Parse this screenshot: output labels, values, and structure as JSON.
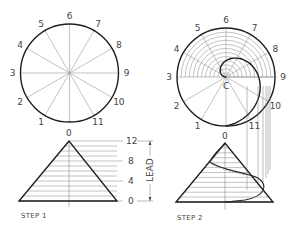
{
  "figure": {
    "step1": {
      "caption": "STEP 1",
      "circle": {
        "cx": 69.5,
        "cy": 73,
        "r": 49
      },
      "division_labels": [
        "0",
        "1",
        "2",
        "3",
        "4",
        "5",
        "6",
        "7",
        "8",
        "9",
        "10",
        "11"
      ],
      "triangle": {
        "apex": [
          69,
          141
        ],
        "base_left": [
          19,
          201
        ],
        "base_right": [
          117,
          201
        ]
      },
      "lead_scale": {
        "labels": [
          {
            "text": "12",
            "y": 141
          },
          {
            "text": "8",
            "y": 161
          },
          {
            "text": "4",
            "y": 181
          },
          {
            "text": "0",
            "y": 201
          }
        ],
        "dimension_label": "LEAD",
        "top_label": "0"
      }
    },
    "step2": {
      "caption": "STEP 2",
      "circle": {
        "cx": 226,
        "cy": 77,
        "r": 49
      },
      "division_labels": [
        "0",
        "1",
        "2",
        "3",
        "4",
        "5",
        "6",
        "7",
        "8",
        "9",
        "10",
        "11"
      ],
      "center_label": "C",
      "triangle": {
        "apex": [
          225,
          143
        ],
        "base_left": [
          176,
          202
        ],
        "base_right": [
          273,
          202
        ]
      },
      "top_label": "0"
    },
    "colors": {
      "ink": "#1e1e1e",
      "construction": "#9a9a9a",
      "text": "#444444"
    }
  }
}
